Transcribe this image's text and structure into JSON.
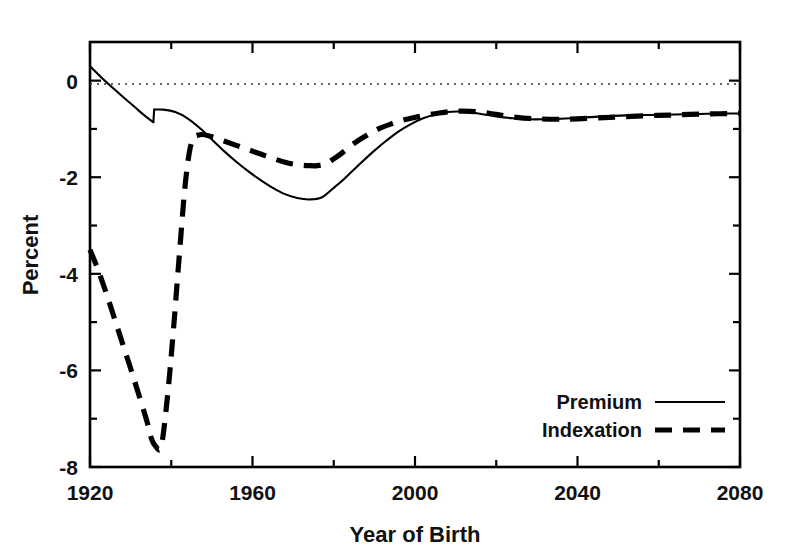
{
  "chart_data": {
    "type": "line",
    "title": "",
    "xlabel": "Year of Birth",
    "ylabel": "Percent",
    "xlim": [
      1920,
      2080
    ],
    "ylim": [
      -8,
      0.8
    ],
    "grid": false,
    "zero_reference_line": true,
    "legend_position": "bottom-right",
    "x_ticks_major": [
      1920,
      1960,
      2000,
      2040,
      2080
    ],
    "x_ticks_minor": [
      1940,
      1980,
      2020,
      2060
    ],
    "y_ticks_major": [
      0,
      -2,
      -4,
      -6,
      -8
    ],
    "y_ticks_minor": [
      -1,
      -3,
      -5,
      -7
    ],
    "x_tick_labels": [
      "1920",
      "1960",
      "2000",
      "2040",
      "2080"
    ],
    "y_tick_labels": [
      "0",
      "-2",
      "-4",
      "-6",
      "-8"
    ],
    "series": [
      {
        "name": "Premium",
        "style": "solid",
        "color": "#000000",
        "x": [
          1920,
          1923,
          1926,
          1929,
          1932,
          1934,
          1935.6,
          1935.8,
          1938,
          1941,
          1944,
          1947,
          1950,
          1953,
          1956,
          1959,
          1962,
          1965,
          1968,
          1971,
          1974,
          1977,
          1980,
          1982,
          1984,
          1987,
          1990,
          1993,
          1996,
          1999,
          2002,
          2005,
          2008,
          2011,
          2014,
          2017,
          2020,
          2024,
          2028,
          2032,
          2036,
          2040,
          2046,
          2052,
          2058,
          2064,
          2070,
          2076,
          2080
        ],
        "y": [
          0.3,
          0.05,
          -0.18,
          -0.4,
          -0.62,
          -0.76,
          -0.86,
          -0.6,
          -0.6,
          -0.65,
          -0.78,
          -0.98,
          -1.22,
          -1.46,
          -1.68,
          -1.88,
          -2.06,
          -2.22,
          -2.35,
          -2.43,
          -2.46,
          -2.42,
          -2.22,
          -2.08,
          -1.92,
          -1.68,
          -1.45,
          -1.24,
          -1.05,
          -0.9,
          -0.78,
          -0.7,
          -0.65,
          -0.64,
          -0.66,
          -0.7,
          -0.74,
          -0.78,
          -0.8,
          -0.8,
          -0.79,
          -0.77,
          -0.74,
          -0.72,
          -0.71,
          -0.7,
          -0.69,
          -0.68,
          -0.68
        ]
      },
      {
        "name": "Indexation",
        "style": "dashed",
        "color": "#000000",
        "x": [
          1920,
          1922,
          1924,
          1926,
          1928,
          1930,
          1932,
          1934,
          1935,
          1936,
          1937.5,
          1939,
          1940.5,
          1942,
          1943.5,
          1945,
          1947,
          1950,
          1953,
          1956,
          1959,
          1962,
          1965,
          1968,
          1971,
          1974,
          1976,
          1978,
          1980,
          1982,
          1985,
          1988,
          1991,
          1994,
          1997,
          2000,
          2003,
          2006,
          2009,
          2012,
          2016,
          2020,
          2025,
          2030,
          2035,
          2040,
          2048,
          2056,
          2064,
          2072,
          2080
        ],
        "y": [
          -3.5,
          -3.92,
          -4.4,
          -4.92,
          -5.44,
          -5.96,
          -6.5,
          -7.05,
          -7.38,
          -7.55,
          -7.58,
          -6.6,
          -5.2,
          -3.6,
          -2.1,
          -1.28,
          -1.12,
          -1.16,
          -1.25,
          -1.34,
          -1.43,
          -1.52,
          -1.61,
          -1.69,
          -1.74,
          -1.76,
          -1.76,
          -1.72,
          -1.62,
          -1.5,
          -1.3,
          -1.14,
          -1.0,
          -0.9,
          -0.82,
          -0.76,
          -0.71,
          -0.67,
          -0.64,
          -0.63,
          -0.65,
          -0.7,
          -0.76,
          -0.79,
          -0.8,
          -0.79,
          -0.76,
          -0.73,
          -0.71,
          -0.69,
          -0.68
        ]
      }
    ],
    "annotations": [
      {
        "text": "Premium series is discontinuous at 1936 (jump from -0.86 to -0.60)"
      },
      {
        "text": "Both series converge near -0.7 percent after 2010"
      }
    ]
  },
  "legend": {
    "items": [
      {
        "label": "Premium",
        "style": "solid"
      },
      {
        "label": "Indexation",
        "style": "dashed"
      }
    ]
  },
  "axes": {
    "x_title": "Year of Birth",
    "y_title": "Percent"
  }
}
